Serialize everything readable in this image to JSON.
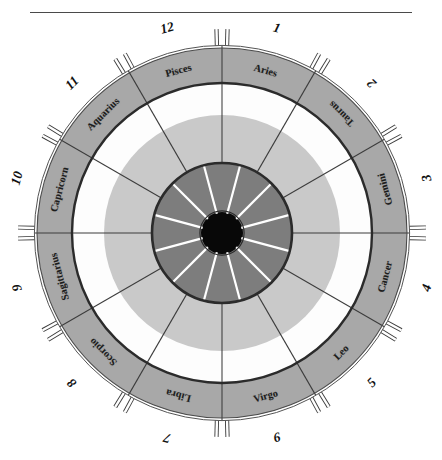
{
  "figure": {
    "title": "",
    "center_x": 222,
    "center_y": 233,
    "has_top_rule": true
  },
  "chart_data": {
    "type": "pie",
    "title": "",
    "subtitle": "",
    "xlabel": "",
    "ylabel": "",
    "legend_position": "none",
    "grid": false,
    "categories": [
      "Capricorn",
      "Sagittarius",
      "Scorpio",
      "Libra",
      "Virgo",
      "Leo",
      "Cancer",
      "Gemini",
      "Taurus",
      "Aries",
      "Pisces",
      "Aquarius"
    ],
    "values": [
      30,
      30,
      30,
      30,
      30,
      30,
      30,
      30,
      30,
      30,
      30,
      30
    ],
    "units": "degrees",
    "sectors": [
      {
        "sign": "Capricorn",
        "house": "10",
        "mid_angle": 285,
        "text_flipped": false
      },
      {
        "sign": "Sagittarius",
        "house": "9",
        "mid_angle": 255,
        "text_flipped": false
      },
      {
        "sign": "Scorpio",
        "house": "8",
        "mid_angle": 225,
        "text_flipped": false
      },
      {
        "sign": "Libra",
        "house": "7",
        "mid_angle": 195,
        "text_flipped": false
      },
      {
        "sign": "Virgo",
        "house": "6",
        "mid_angle": 165,
        "text_flipped": true
      },
      {
        "sign": "Leo",
        "house": "5",
        "mid_angle": 135,
        "text_flipped": true
      },
      {
        "sign": "Cancer",
        "house": "4",
        "mid_angle": 105,
        "text_flipped": true
      },
      {
        "sign": "Gemini",
        "house": "3",
        "mid_angle": 75,
        "text_flipped": true
      },
      {
        "sign": "Taurus",
        "house": "2",
        "mid_angle": 45,
        "text_flipped": true
      },
      {
        "sign": "Aries",
        "house": "1",
        "mid_angle": 15,
        "text_flipped": false
      },
      {
        "sign": "Pisces",
        "house": "12",
        "mid_angle": 345,
        "text_flipped": false
      },
      {
        "sign": "Aquarius",
        "house": "11",
        "mid_angle": 315,
        "text_flipped": false
      }
    ],
    "rings": [
      {
        "name": "hub",
        "inner_radius": 0,
        "outer_radius": 21,
        "color": "#080808"
      },
      {
        "name": "inner-dark-ring",
        "inner_radius": 21,
        "outer_radius": 70,
        "color": "#7d7d7d"
      },
      {
        "name": "mid-light-ring",
        "inner_radius": 70,
        "outer_radius": 118,
        "color": "#c9c9c9"
      },
      {
        "name": "white-gap",
        "inner_radius": 118,
        "outer_radius": 150,
        "color": "#fdfdfd"
      },
      {
        "name": "zodiac-band",
        "inner_radius": 150,
        "outer_radius": 185,
        "color": "#a8a8a8"
      },
      {
        "name": "outer-rim",
        "inner_radius": 185,
        "outer_radius": 191,
        "color": "#ffffff"
      }
    ],
    "colors": {
      "hub": "#080808",
      "inner_ring": "#7d7d7d",
      "mid_ring": "#c9c9c9",
      "gap": "#fdfdfd",
      "band": "#a8a8a8",
      "spoke_light": "#ffffff",
      "spoke_dark": "#3c3c3c",
      "outline": "#2b2b2b",
      "rule": "#4a4a4a"
    },
    "tick_marks": {
      "count": 12,
      "style": "paired-hollow-pins",
      "description": "A pair of thin hollow rectangular pins projects outward at each 30-degree sign boundary"
    }
  }
}
